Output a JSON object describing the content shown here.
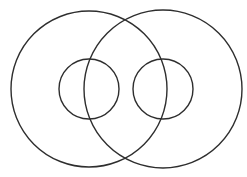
{
  "diagram": {
    "width": 247,
    "height": 177,
    "background": "#ffffff",
    "stroke_color": "#2e2e2e",
    "stroke_width": 1.4,
    "circles": [
      {
        "id": "large-left",
        "cx": 89,
        "cy": 89,
        "r": 78
      },
      {
        "id": "large-right",
        "cx": 163,
        "cy": 89,
        "r": 79
      },
      {
        "id": "small-left",
        "cx": 89,
        "cy": 89,
        "r": 30
      },
      {
        "id": "small-right",
        "cx": 163,
        "cy": 89,
        "r": 30
      }
    ]
  }
}
